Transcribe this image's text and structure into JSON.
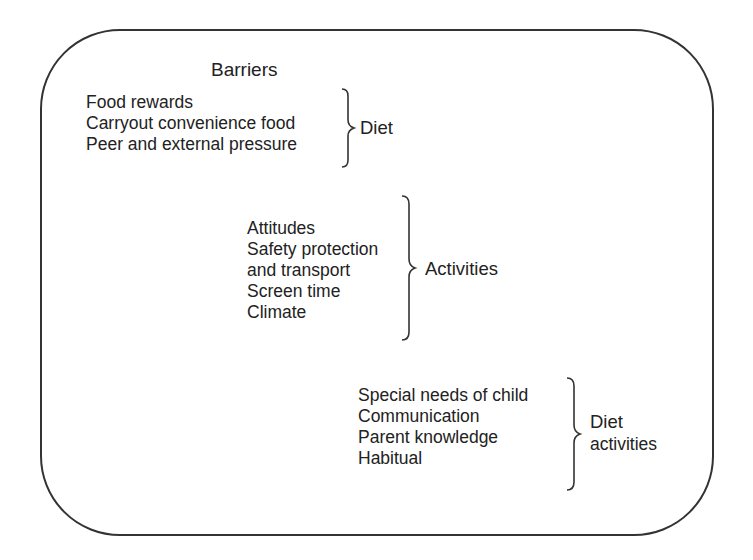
{
  "title": "Barriers",
  "groups": [
    {
      "items": [
        "Food rewards",
        "Carryout convenience food",
        "Peer and external pressure"
      ],
      "label": [
        "Diet"
      ]
    },
    {
      "items": [
        "Attitudes",
        "Safety protection",
        "and transport",
        "Screen time",
        "Climate"
      ],
      "label": [
        "Activities"
      ]
    },
    {
      "items": [
        "Special needs of child",
        "Communication",
        "Parent knowledge",
        "Habitual"
      ],
      "label": [
        "Diet",
        "activities"
      ]
    }
  ]
}
